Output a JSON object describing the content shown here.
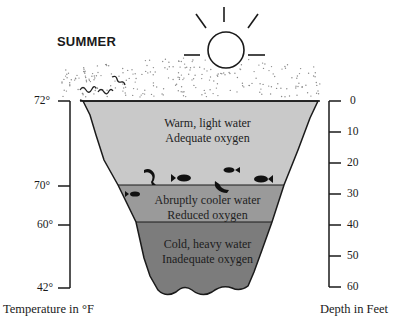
{
  "title": "SUMMER",
  "layers": [
    {
      "name": "epilimnion",
      "line1": "Warm, light water",
      "line2": "Adequate oxygen",
      "color": "#c9c9c9"
    },
    {
      "name": "thermocline",
      "line1": "Abruptly cooler water",
      "line2": "Reduced oxygen",
      "color": "#9a9a9a"
    },
    {
      "name": "hypolimnion",
      "line1": "Cold, heavy water",
      "line2": "Inadequate oxygen",
      "color": "#7c7c7c"
    }
  ],
  "temperature_axis": {
    "title": "Temperature in °F",
    "ticks": [
      "72°",
      "70°",
      "60°",
      "42°"
    ]
  },
  "depth_axis": {
    "title": "Depth in Feet",
    "ticks": [
      "0",
      "10",
      "20",
      "30",
      "40",
      "50",
      "60"
    ]
  },
  "icons": [
    "sun-icon",
    "fish-icon",
    "wind-wave-icon"
  ],
  "colors": {
    "outline": "#1a1a1a",
    "background": "#ffffff",
    "air_dots": "#8a8a8a"
  }
}
